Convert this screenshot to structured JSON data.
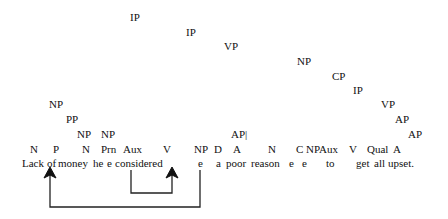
{
  "diagram": {
    "type": "syntax-tree",
    "nodes": [
      {
        "label": "IP",
        "x": 130,
        "y": 11
      },
      {
        "label": "IP",
        "x": 186,
        "y": 26
      },
      {
        "label": "VP",
        "x": 224,
        "y": 40
      },
      {
        "label": "NP",
        "x": 297,
        "y": 55
      },
      {
        "label": "CP",
        "x": 332,
        "y": 70
      },
      {
        "label": "IP",
        "x": 353,
        "y": 84
      },
      {
        "label": "VP",
        "x": 381,
        "y": 98
      },
      {
        "label": "AP",
        "x": 395,
        "y": 113
      },
      {
        "label": "AP",
        "x": 408,
        "y": 128
      },
      {
        "label": "NP",
        "x": 49,
        "y": 98
      },
      {
        "label": "PP",
        "x": 66,
        "y": 113
      },
      {
        "label": "NP",
        "x": 77,
        "y": 128
      },
      {
        "label": "NP",
        "x": 101,
        "y": 128
      },
      {
        "label": "AP|",
        "x": 231,
        "y": 128
      }
    ],
    "categories": [
      {
        "label": "N",
        "x": 30
      },
      {
        "label": "P",
        "x": 53
      },
      {
        "label": "N",
        "x": 82
      },
      {
        "label": "Prn",
        "x": 101
      },
      {
        "label": "Aux",
        "x": 123
      },
      {
        "label": "V",
        "x": 163
      },
      {
        "label": "NP",
        "x": 194
      },
      {
        "label": "D",
        "x": 214
      },
      {
        "label": "A",
        "x": 233
      },
      {
        "label": "N",
        "x": 268
      },
      {
        "label": "C",
        "x": 296
      },
      {
        "label": "NPAux",
        "x": 306
      },
      {
        "label": "V",
        "x": 349
      },
      {
        "label": "Qual",
        "x": 367
      },
      {
        "label": "A",
        "x": 393
      }
    ],
    "sentence": "Lack of money he  e considered e   a poor reason  e  e    to    get all upset.",
    "words": [
      {
        "text": "Lack",
        "x": 22
      },
      {
        "text": "of",
        "x": 47
      },
      {
        "text": "money",
        "x": 58
      },
      {
        "text": "he",
        "x": 93
      },
      {
        "text": "e",
        "x": 107
      },
      {
        "text": "considered",
        "x": 115
      },
      {
        "text": "e",
        "x": 198
      },
      {
        "text": "a",
        "x": 216
      },
      {
        "text": "poor",
        "x": 226
      },
      {
        "text": "reason",
        "x": 251
      },
      {
        "text": "e",
        "x": 289
      },
      {
        "text": "e",
        "x": 302
      },
      {
        "text": "to",
        "x": 326
      },
      {
        "text": "get",
        "x": 356
      },
      {
        "text": "all",
        "x": 374
      },
      {
        "text": "upset.",
        "x": 388
      }
    ],
    "arrows": [
      {
        "name": "movement-arrow-subject",
        "from_word": "e (after considered)",
        "to_word": "Lack"
      },
      {
        "name": "movement-arrow-aux",
        "from_word": "e (after he)",
        "to_word": "considered"
      }
    ]
  }
}
